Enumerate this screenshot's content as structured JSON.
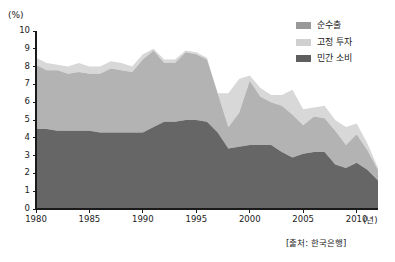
{
  "chart_data": {
    "type": "area",
    "stacked": true,
    "title": "",
    "subtitle": "",
    "xlabel": "(년)",
    "ylabel": "(%)",
    "ylim": [
      0,
      10
    ],
    "xlim": [
      1980,
      2012
    ],
    "grid": false,
    "legend_position": "top-right",
    "y_ticks": [
      "0",
      "1",
      "2",
      "3",
      "4",
      "5",
      "6",
      "7",
      "8",
      "9",
      "10"
    ],
    "x_ticks": [
      "1980",
      "1985",
      "1990",
      "1995",
      "2000",
      "2005",
      "2010"
    ],
    "x": [
      1980,
      1981,
      1982,
      1983,
      1984,
      1985,
      1986,
      1987,
      1988,
      1989,
      1990,
      1991,
      1992,
      1993,
      1994,
      1995,
      1996,
      1997,
      1998,
      1999,
      2000,
      2001,
      2002,
      2003,
      2004,
      2005,
      2006,
      2007,
      2008,
      2009,
      2010,
      2011,
      2012
    ],
    "series": [
      {
        "name": "민간 소비",
        "color": "#666666",
        "values": [
          4.5,
          4.5,
          4.4,
          4.4,
          4.4,
          4.4,
          4.3,
          4.3,
          4.3,
          4.3,
          4.3,
          4.6,
          4.9,
          4.9,
          5.0,
          5.0,
          4.9,
          4.3,
          3.4,
          3.5,
          3.6,
          3.6,
          3.6,
          3.2,
          2.9,
          3.1,
          3.2,
          3.2,
          2.5,
          2.3,
          2.6,
          2.2,
          1.6
        ]
      },
      {
        "name": "고정 투자",
        "color": "#b3b3b3",
        "values": [
          3.6,
          3.3,
          3.4,
          3.2,
          3.3,
          3.2,
          3.3,
          3.6,
          3.5,
          3.4,
          4.1,
          4.3,
          3.3,
          3.3,
          3.8,
          3.7,
          3.5,
          2.2,
          1.2,
          1.9,
          3.6,
          2.7,
          2.4,
          2.6,
          2.4,
          1.6,
          2.0,
          1.9,
          1.9,
          1.3,
          1.6,
          1.1,
          0.6
        ]
      },
      {
        "name": "순수출",
        "color": "#d8d8d8",
        "values": [
          0.4,
          0.4,
          0.3,
          0.4,
          0.5,
          0.4,
          0.4,
          0.4,
          0.4,
          0.3,
          0.3,
          0.1,
          0.2,
          0.2,
          0.1,
          0.1,
          0.1,
          0.0,
          1.9,
          1.9,
          0.3,
          0.5,
          0.4,
          0.6,
          1.4,
          0.9,
          0.5,
          0.7,
          0.6,
          1.0,
          0.6,
          0.4,
          0.1
        ]
      }
    ],
    "source": "[출처: 한국은행]"
  },
  "legend": {
    "items": [
      {
        "label": "순수출",
        "color": "#999999"
      },
      {
        "label": "고정 투자",
        "color": "#d0d0d0"
      },
      {
        "label": "민간 소비",
        "color": "#5f5f5f"
      }
    ]
  },
  "axes": {
    "y_unit": "(%)",
    "x_unit": "(년)"
  },
  "footer": {
    "source": "[출처: 한국은행]"
  }
}
